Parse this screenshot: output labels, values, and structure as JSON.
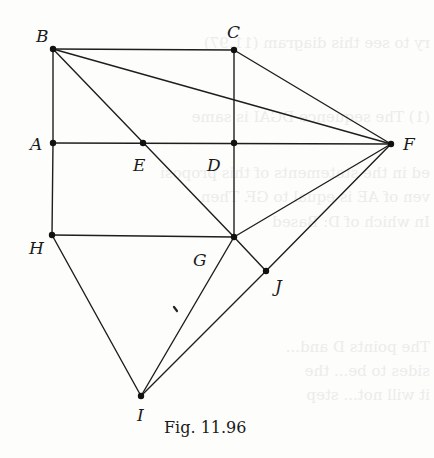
{
  "figure": {
    "caption": "Fig. 11.96",
    "vertices": [
      {
        "id": "A",
        "label": "A",
        "x": 53,
        "y": 143,
        "lx": 30,
        "ly": 150
      },
      {
        "id": "B",
        "label": "B",
        "x": 53,
        "y": 49,
        "lx": 36,
        "ly": 42
      },
      {
        "id": "C",
        "label": "C",
        "x": 234,
        "y": 50,
        "lx": 227,
        "ly": 38
      },
      {
        "id": "D",
        "label": "D",
        "x": 234,
        "y": 143,
        "lx": 207,
        "ly": 171
      },
      {
        "id": "E",
        "label": "E",
        "x": 143,
        "y": 143,
        "lx": 133,
        "ly": 171
      },
      {
        "id": "F",
        "label": "F",
        "x": 391,
        "y": 144,
        "lx": 403,
        "ly": 150
      },
      {
        "id": "G",
        "label": "G",
        "x": 234,
        "y": 237,
        "lx": 193,
        "ly": 266
      },
      {
        "id": "H",
        "label": "H",
        "x": 52,
        "y": 235,
        "lx": 29,
        "ly": 254
      },
      {
        "id": "I",
        "label": "I",
        "x": 141,
        "y": 396,
        "lx": 137,
        "ly": 421
      },
      {
        "id": "J",
        "label": "J",
        "x": 266,
        "y": 271,
        "lx": 275,
        "ly": 292
      }
    ],
    "edges": [
      [
        "B",
        "C"
      ],
      [
        "B",
        "A"
      ],
      [
        "B",
        "F"
      ],
      [
        "B",
        "G"
      ],
      [
        "C",
        "D"
      ],
      [
        "C",
        "F"
      ],
      [
        "A",
        "F"
      ],
      [
        "D",
        "G"
      ],
      [
        "A",
        "H"
      ],
      [
        "H",
        "G"
      ],
      [
        "G",
        "F"
      ],
      [
        "G",
        "J"
      ],
      [
        "J",
        "F"
      ],
      [
        "H",
        "I"
      ],
      [
        "G",
        "I"
      ],
      [
        "J",
        "I"
      ]
    ],
    "stray_mark": {
      "x1": 174,
      "y1": 307,
      "x2": 177,
      "y2": 311
    }
  },
  "bleed_through": [
    "ry to see this diagram (11.97)",
    "(1) The sequence DGAI is same",
    "ed in the statements of this proposi",
    "ven of AE is equal to GF. Then",
    "In which of D: Based",
    "The points D and... ",
    "sides to be... the",
    "it will not... step"
  ]
}
